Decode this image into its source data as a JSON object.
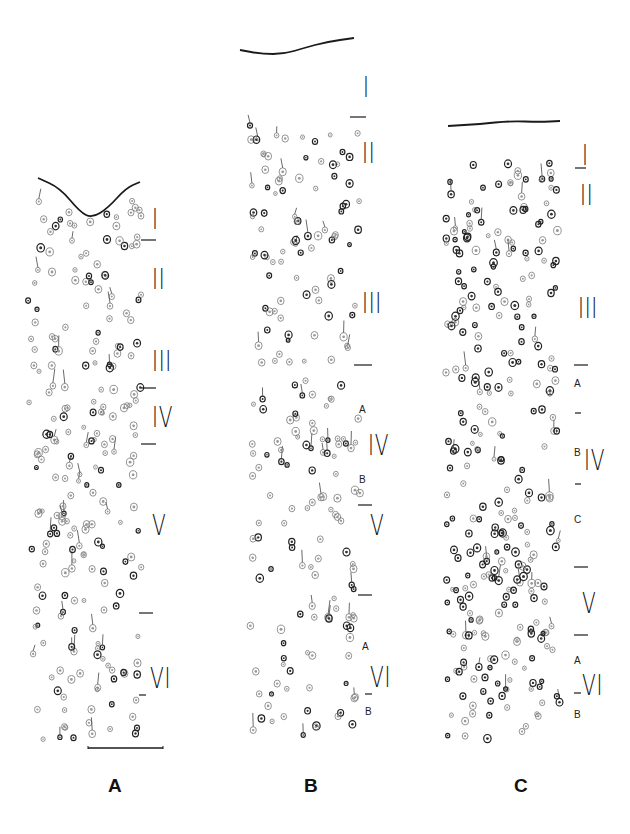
{
  "figure": {
    "ink_color": "#1a1a1a",
    "background": "#ffffff"
  },
  "panels": [
    {
      "id": "A",
      "label": "A",
      "label_pos": [
        108,
        776
      ],
      "column": {
        "x0": 28,
        "x1": 142,
        "y0": 200,
        "y1": 740
      },
      "surface": {
        "type": "wave",
        "points": [
          [
            38,
            178
          ],
          [
            60,
            188
          ],
          [
            80,
            212
          ],
          [
            92,
            218
          ],
          [
            108,
            208
          ],
          [
            126,
            188
          ],
          [
            140,
            182
          ]
        ]
      },
      "scale_bar": {
        "x0": 88,
        "x1": 163,
        "y": 748
      },
      "layers": [
        {
          "name": "I",
          "x": 152,
          "y": 206,
          "size": 24
        },
        {
          "name": "II",
          "x": 152,
          "y": 266,
          "size": 24
        },
        {
          "name": "III",
          "x": 152,
          "y": 348,
          "size": 24
        },
        {
          "name": "IV",
          "x": 152,
          "y": 404,
          "size": 24
        },
        {
          "name": "V",
          "x": 152,
          "y": 512,
          "size": 24
        },
        {
          "name": "VI",
          "x": 150,
          "y": 665,
          "size": 24
        }
      ],
      "ticks": [
        {
          "x0": 141,
          "x1": 156,
          "y": 240
        },
        {
          "x0": 141,
          "x1": 156,
          "y": 388
        },
        {
          "x0": 141,
          "x1": 156,
          "y": 444
        },
        {
          "x0": 139,
          "x1": 153,
          "y": 613
        },
        {
          "x0": 139,
          "x1": 146,
          "y": 695
        }
      ],
      "sublabels": [],
      "cell_density": 230,
      "seed": 11
    },
    {
      "id": "B",
      "label": "B",
      "label_pos": [
        304,
        776
      ],
      "column": {
        "x0": 250,
        "x1": 360,
        "y0": 120,
        "y1": 740
      },
      "surface": {
        "type": "wave",
        "points": [
          [
            240,
            50
          ],
          [
            262,
            54
          ],
          [
            284,
            54
          ],
          [
            304,
            48
          ],
          [
            326,
            42
          ],
          [
            354,
            38
          ]
        ]
      },
      "scale_bar": null,
      "layers": [
        {
          "name": "I",
          "x": 363,
          "y": 74,
          "size": 24
        },
        {
          "name": "II",
          "x": 362,
          "y": 140,
          "size": 24
        },
        {
          "name": "III",
          "x": 362,
          "y": 290,
          "size": 24
        },
        {
          "name": "IV",
          "x": 368,
          "y": 432,
          "size": 24
        },
        {
          "name": "V",
          "x": 370,
          "y": 512,
          "size": 24
        },
        {
          "name": "VI",
          "x": 370,
          "y": 664,
          "size": 24
        }
      ],
      "ticks": [
        {
          "x0": 350,
          "x1": 366,
          "y": 117
        },
        {
          "x0": 354,
          "x1": 372,
          "y": 365
        },
        {
          "x0": 358,
          "x1": 372,
          "y": 505
        },
        {
          "x0": 358,
          "x1": 372,
          "y": 595
        },
        {
          "x0": 365,
          "x1": 372,
          "y": 694
        }
      ],
      "sublabels": [
        {
          "text": "A",
          "x": 359,
          "y": 405
        },
        {
          "text": "B",
          "x": 359,
          "y": 475
        },
        {
          "text": "A",
          "x": 362,
          "y": 642
        },
        {
          "text": "B",
          "x": 365,
          "y": 707
        }
      ],
      "cell_density": 210,
      "seed": 29
    },
    {
      "id": "C",
      "label": "C",
      "label_pos": [
        514,
        776
      ],
      "column": {
        "x0": 445,
        "x1": 560,
        "y0": 160,
        "y1": 740
      },
      "surface": {
        "type": "line",
        "points": [
          [
            448,
            126
          ],
          [
            480,
            124
          ],
          [
            510,
            121
          ],
          [
            540,
            122
          ],
          [
            560,
            121
          ]
        ]
      },
      "scale_bar": null,
      "layers": [
        {
          "name": "I",
          "x": 582,
          "y": 142,
          "size": 24
        },
        {
          "name": "II",
          "x": 580,
          "y": 182,
          "size": 24
        },
        {
          "name": "III",
          "x": 578,
          "y": 295,
          "size": 24
        },
        {
          "name": "IV",
          "x": 584,
          "y": 447,
          "size": 24
        },
        {
          "name": "V",
          "x": 582,
          "y": 590,
          "size": 24
        },
        {
          "name": "VI",
          "x": 582,
          "y": 672,
          "size": 24
        }
      ],
      "ticks": [
        {
          "x0": 575,
          "x1": 586,
          "y": 168
        },
        {
          "x0": 574,
          "x1": 588,
          "y": 365
        },
        {
          "x0": 575,
          "x1": 581,
          "y": 413
        },
        {
          "x0": 575,
          "x1": 581,
          "y": 484
        },
        {
          "x0": 574,
          "x1": 588,
          "y": 567
        },
        {
          "x0": 574,
          "x1": 588,
          "y": 635
        },
        {
          "x0": 574,
          "x1": 581,
          "y": 693
        }
      ],
      "sublabels": [
        {
          "text": "A",
          "x": 574,
          "y": 379
        },
        {
          "text": "B",
          "x": 574,
          "y": 448
        },
        {
          "text": "C",
          "x": 574,
          "y": 515
        },
        {
          "text": "A",
          "x": 574,
          "y": 656
        },
        {
          "text": "B",
          "x": 574,
          "y": 710
        }
      ],
      "cell_density": 300,
      "seed": 53
    }
  ]
}
